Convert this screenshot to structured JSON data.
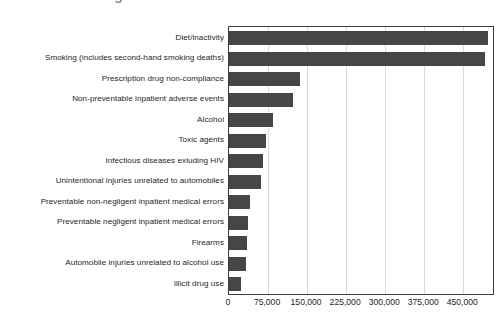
{
  "figure": {
    "title_partial": "Leading Causes of Death in the United States",
    "title_cropped": true
  },
  "chart_data": {
    "type": "bar",
    "orientation": "horizontal",
    "title": "Leading Causes of Death in the United States",
    "xlabel": "",
    "ylabel": "",
    "xlim": [
      0,
      507000
    ],
    "xticks": [
      0,
      75000,
      150000,
      225000,
      300000,
      375000,
      450000
    ],
    "xtick_labels": [
      "0",
      "75,000",
      "150,000",
      "225,000",
      "300,000",
      "375,000",
      "450,000"
    ],
    "grid": true,
    "grid_axis": "x",
    "legend": false,
    "bar_color": "#464646",
    "categories": [
      "Diet/inactivity",
      "Smoking (includes second-hand smoking deaths)",
      "Prescription drug non-compliance",
      "Non-preventable inpatient adverse events",
      "Alcohol",
      "Toxic agents",
      "Infectious diseases exluding HIV",
      "Unintentional injuries unrelated to automobiles",
      "Preventable non-negligent inpatient medical errors",
      "Preventable negligent inpatient medical errors",
      "Firearms",
      "Automobile injuries unrelated to alcohol use",
      "Illicit drug use"
    ],
    "values": [
      498000,
      492000,
      137000,
      123000,
      85000,
      71000,
      65000,
      61500,
      40000,
      36500,
      34600,
      32700,
      23000
    ]
  }
}
